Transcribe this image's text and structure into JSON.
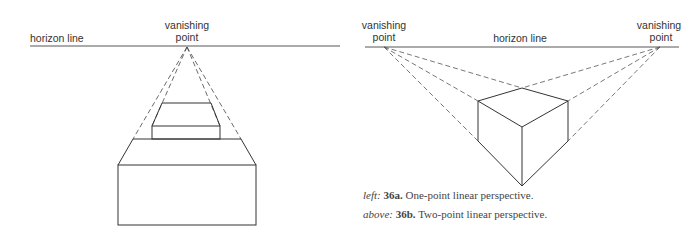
{
  "figure_a": {
    "horizon_label": "horizon line",
    "vp_label_line1": "vanishing",
    "vp_label_line2": "point",
    "caption_prefix": "left:",
    "caption_number": "36a.",
    "caption_text": "One-point linear perspective."
  },
  "figure_b": {
    "horizon_label": "horizon line",
    "vp_left_line1": "vanishing",
    "vp_left_line2": "point",
    "vp_right_line1": "vanishing",
    "vp_right_line2": "point",
    "caption_prefix": "above:",
    "caption_number": "36b.",
    "caption_text": "Two-point linear perspective."
  },
  "colors": {
    "line": "#333333",
    "dash": "#555555",
    "background": "#ffffff"
  }
}
